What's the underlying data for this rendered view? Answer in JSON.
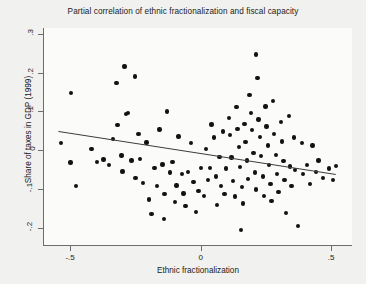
{
  "chart_data": {
    "type": "scatter",
    "title": "Partial correlation of ethnic fractionalization and fiscal capacity",
    "xlabel": "Ethnic fractionalization",
    "ylabel": "Share of taxes in GDP (1999)",
    "xlim": [
      -0.6,
      0.58
    ],
    "ylim": [
      -0.245,
      0.315
    ],
    "xticks": [
      -0.5,
      0,
      0.5
    ],
    "xtick_labels": [
      "-.5",
      "0",
      ".5"
    ],
    "yticks": [
      -0.2,
      -0.1,
      0,
      0.1,
      0.2,
      0.3
    ],
    "ytick_labels": [
      "-.2",
      "-.1",
      "0",
      ".1",
      ".2",
      ".3"
    ],
    "grid": false,
    "legend": null,
    "marker_color": "#121212",
    "line_color": "#3c3c3c",
    "fit_line": {
      "type": "linear",
      "x_start": -0.545,
      "y_start": 0.048,
      "x_end": 0.518,
      "y_end": -0.063,
      "slope": -0.1044,
      "intercept": -0.0089
    },
    "points": [
      {
        "x": -0.536,
        "y": 0.018
      },
      {
        "x": -0.497,
        "y": 0.147
      },
      {
        "x": -0.498,
        "y": -0.032
      },
      {
        "x": -0.478,
        "y": -0.093
      },
      {
        "x": -0.418,
        "y": 0.002
      },
      {
        "x": -0.398,
        "y": -0.031
      },
      {
        "x": -0.372,
        "y": -0.024
      },
      {
        "x": -0.352,
        "y": -0.038
      },
      {
        "x": -0.336,
        "y": 0.028
      },
      {
        "x": -0.322,
        "y": 0.173
      },
      {
        "x": -0.318,
        "y": 0.064
      },
      {
        "x": -0.303,
        "y": -0.014
      },
      {
        "x": -0.299,
        "y": -0.055
      },
      {
        "x": -0.292,
        "y": 0.216
      },
      {
        "x": -0.286,
        "y": 0.093
      },
      {
        "x": -0.279,
        "y": 0.096
      },
      {
        "x": -0.265,
        "y": -0.027
      },
      {
        "x": -0.252,
        "y": 0.19
      },
      {
        "x": -0.249,
        "y": -0.072
      },
      {
        "x": -0.238,
        "y": 0.041
      },
      {
        "x": -0.232,
        "y": -0.023
      },
      {
        "x": -0.221,
        "y": -0.085
      },
      {
        "x": -0.208,
        "y": 0.02
      },
      {
        "x": -0.198,
        "y": -0.128
      },
      {
        "x": -0.188,
        "y": -0.165
      },
      {
        "x": -0.176,
        "y": -0.046
      },
      {
        "x": -0.168,
        "y": -0.092
      },
      {
        "x": -0.158,
        "y": 0.053
      },
      {
        "x": -0.146,
        "y": -0.037
      },
      {
        "x": -0.139,
        "y": -0.114
      },
      {
        "x": -0.128,
        "y": 0.1
      },
      {
        "x": -0.118,
        "y": -0.058
      },
      {
        "x": -0.108,
        "y": -0.03
      },
      {
        "x": -0.098,
        "y": -0.134
      },
      {
        "x": -0.092,
        "y": -0.091
      },
      {
        "x": -0.085,
        "y": 0.035
      },
      {
        "x": -0.072,
        "y": -0.062
      },
      {
        "x": -0.066,
        "y": -0.112
      },
      {
        "x": -0.058,
        "y": -0.145
      },
      {
        "x": -0.048,
        "y": -0.057
      },
      {
        "x": -0.038,
        "y": 0.018
      },
      {
        "x": -0.028,
        "y": -0.082
      },
      {
        "x": -0.018,
        "y": -0.16
      },
      {
        "x": -0.008,
        "y": -0.105
      },
      {
        "x": 0.002,
        "y": -0.047
      },
      {
        "x": 0.013,
        "y": -0.118
      },
      {
        "x": 0.021,
        "y": 0.002
      },
      {
        "x": 0.028,
        "y": -0.078
      },
      {
        "x": 0.035,
        "y": -0.046
      },
      {
        "x": 0.042,
        "y": 0.066
      },
      {
        "x": 0.052,
        "y": 0.032
      },
      {
        "x": 0.058,
        "y": -0.068
      },
      {
        "x": 0.062,
        "y": -0.142
      },
      {
        "x": 0.072,
        "y": -0.018
      },
      {
        "x": 0.078,
        "y": -0.093
      },
      {
        "x": 0.086,
        "y": 0.048
      },
      {
        "x": 0.092,
        "y": -0.113
      },
      {
        "x": 0.098,
        "y": -0.048
      },
      {
        "x": 0.108,
        "y": 0.082
      },
      {
        "x": 0.112,
        "y": 0.039
      },
      {
        "x": 0.118,
        "y": -0.019
      },
      {
        "x": 0.124,
        "y": -0.08
      },
      {
        "x": 0.131,
        "y": -0.12
      },
      {
        "x": 0.138,
        "y": 0.111
      },
      {
        "x": 0.142,
        "y": 0.054
      },
      {
        "x": 0.148,
        "y": 0.008
      },
      {
        "x": 0.152,
        "y": -0.043
      },
      {
        "x": 0.158,
        "y": -0.096
      },
      {
        "x": 0.162,
        "y": -0.138
      },
      {
        "x": 0.168,
        "y": 0.068
      },
      {
        "x": 0.172,
        "y": 0.021
      },
      {
        "x": 0.178,
        "y": -0.027
      },
      {
        "x": 0.182,
        "y": -0.074
      },
      {
        "x": 0.188,
        "y": 0.142
      },
      {
        "x": 0.192,
        "y": 0.096
      },
      {
        "x": 0.198,
        "y": 0.052
      },
      {
        "x": 0.202,
        "y": -0.008
      },
      {
        "x": 0.208,
        "y": -0.058
      },
      {
        "x": 0.212,
        "y": -0.102
      },
      {
        "x": 0.218,
        "y": 0.186
      },
      {
        "x": 0.222,
        "y": 0.079
      },
      {
        "x": 0.228,
        "y": 0.034
      },
      {
        "x": 0.232,
        "y": -0.016
      },
      {
        "x": 0.238,
        "y": -0.068
      },
      {
        "x": 0.242,
        "y": -0.118
      },
      {
        "x": 0.248,
        "y": 0.112
      },
      {
        "x": 0.252,
        "y": 0.061
      },
      {
        "x": 0.258,
        "y": 0.012
      },
      {
        "x": 0.262,
        "y": -0.038
      },
      {
        "x": 0.268,
        "y": -0.088
      },
      {
        "x": 0.272,
        "y": -0.132
      },
      {
        "x": 0.278,
        "y": 0.126
      },
      {
        "x": 0.282,
        "y": 0.042
      },
      {
        "x": 0.288,
        "y": -0.012
      },
      {
        "x": 0.292,
        "y": -0.062
      },
      {
        "x": 0.298,
        "y": -0.108
      },
      {
        "x": 0.308,
        "y": 0.072
      },
      {
        "x": 0.312,
        "y": 0.022
      },
      {
        "x": 0.318,
        "y": -0.028
      },
      {
        "x": 0.322,
        "y": -0.078
      },
      {
        "x": 0.328,
        "y": -0.162
      },
      {
        "x": 0.338,
        "y": 0.088
      },
      {
        "x": 0.342,
        "y": -0.042
      },
      {
        "x": 0.348,
        "y": -0.092
      },
      {
        "x": 0.358,
        "y": 0.032
      },
      {
        "x": 0.362,
        "y": -0.052
      },
      {
        "x": 0.372,
        "y": -0.196
      },
      {
        "x": 0.388,
        "y": 0.018
      },
      {
        "x": 0.392,
        "y": -0.062
      },
      {
        "x": 0.408,
        "y": -0.038
      },
      {
        "x": 0.418,
        "y": -0.088
      },
      {
        "x": 0.428,
        "y": 0.012
      },
      {
        "x": 0.442,
        "y": -0.056
      },
      {
        "x": 0.452,
        "y": -0.027
      },
      {
        "x": 0.468,
        "y": -0.072
      },
      {
        "x": 0.492,
        "y": -0.048
      },
      {
        "x": 0.508,
        "y": -0.078
      },
      {
        "x": 0.518,
        "y": -0.041
      },
      {
        "x": 0.212,
        "y": 0.247
      },
      {
        "x": 0.155,
        "y": -0.206
      },
      {
        "x": -0.141,
        "y": -0.178
      }
    ]
  }
}
